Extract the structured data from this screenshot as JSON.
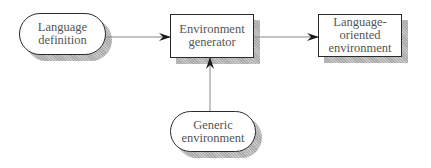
{
  "diagram": {
    "nodes": [
      {
        "id": "language-definition",
        "shape": "rounded",
        "label": "Language\ndefinition"
      },
      {
        "id": "environment-generator",
        "shape": "rectangle",
        "label": "Environment\ngenerator"
      },
      {
        "id": "language-oriented-environment",
        "shape": "rectangle",
        "label": "Language-\noriented\nenvironment"
      },
      {
        "id": "generic-environment",
        "shape": "rounded",
        "label": "Generic\nenvironment"
      }
    ],
    "edges": [
      {
        "from": "language-definition",
        "to": "environment-generator"
      },
      {
        "from": "environment-generator",
        "to": "language-oriented-environment"
      },
      {
        "from": "generic-environment",
        "to": "environment-generator"
      }
    ],
    "colors": {
      "stroke": "#2a2a2a",
      "text": "#555555",
      "shadow": "#b8b8b8",
      "arrow_line": "#888888"
    }
  }
}
